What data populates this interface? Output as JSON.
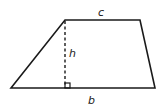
{
  "diagram": {
    "shape": "trapezoid",
    "labels": {
      "top_side": "c",
      "height": "h",
      "base": "b"
    },
    "colors": {
      "stroke": "#1a1a1a",
      "background": "#ffffff"
    }
  }
}
